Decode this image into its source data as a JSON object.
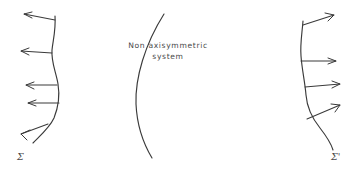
{
  "figure": {
    "background_color": "#ffffff",
    "stroke_color": "#3a3a3a",
    "text_color": "#4a4a4a",
    "width": 359,
    "height": 171,
    "caption": {
      "line_1": "Non axisymmetric",
      "line_2": "system"
    },
    "labels": {
      "left_surface": "Σ",
      "right_surface": "Σ'"
    },
    "curves": [
      {
        "name": "left-surface-curve",
        "label": "Σ",
        "description": "wavy vertical curve, bulges right at mid-height, tail curves to lower-left",
        "path": "M 55 16 C 56 30 53 40 52 50 C 51 62 56 72 58 84 C 60 96 58 108 54 118 C 50 127 42 134 33 143"
      },
      {
        "name": "middle-surface-curve",
        "description": "smooth arc bulging to the left, no arrows",
        "path": "M 164 14 C 145 44 135 78 136 104 C 137 126 143 143 152 158"
      },
      {
        "name": "right-surface-curve",
        "label": "Σ'",
        "description": "wavy vertical curve, bulges left at mid-height, tail curves to lower-right",
        "path": "M 303 21 C 302 34 300 44 301 56 C 302 70 305 82 306 95 C 307 108 312 118 320 128 C 327 137 331 143 333 150"
      }
    ],
    "arrows": [
      {
        "name": "left-arrow-1",
        "side": "left",
        "direction": "up-left",
        "tail_x": 55,
        "tail_y": 20,
        "tip_x": 24,
        "tip_y": 14
      },
      {
        "name": "left-arrow-2",
        "side": "left",
        "direction": "left",
        "tail_x": 52,
        "tail_y": 53,
        "tip_x": 21,
        "tip_y": 51
      },
      {
        "name": "left-arrow-3",
        "side": "left",
        "direction": "left",
        "tail_x": 57,
        "tail_y": 85,
        "tip_x": 26,
        "tip_y": 85
      },
      {
        "name": "left-arrow-4",
        "side": "left",
        "direction": "left",
        "tail_x": 59,
        "tail_y": 103,
        "tip_x": 28,
        "tip_y": 103
      },
      {
        "name": "left-arrow-5",
        "side": "left",
        "direction": "down-left",
        "tail_x": 48,
        "tail_y": 124,
        "tip_x": 21,
        "tip_y": 134
      },
      {
        "name": "right-arrow-1",
        "side": "right",
        "direction": "up-right",
        "tail_x": 303,
        "tail_y": 25,
        "tip_x": 334,
        "tip_y": 15
      },
      {
        "name": "right-arrow-2",
        "side": "right",
        "direction": "right",
        "tail_x": 301,
        "tail_y": 61,
        "tip_x": 336,
        "tip_y": 61
      },
      {
        "name": "right-arrow-3",
        "side": "right",
        "direction": "right",
        "tail_x": 305,
        "tail_y": 87,
        "tip_x": 340,
        "tip_y": 84
      },
      {
        "name": "right-arrow-4",
        "side": "right",
        "direction": "up-right",
        "tail_x": 307,
        "tail_y": 119,
        "tip_x": 340,
        "tip_y": 105
      }
    ]
  }
}
